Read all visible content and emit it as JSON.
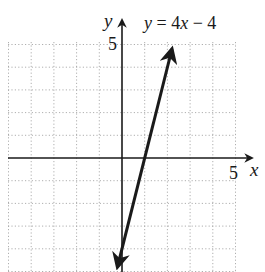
{
  "chart_data": {
    "type": "line",
    "title": "",
    "equation_label": "y = 4x − 4",
    "xlabel": "x",
    "ylabel": "y",
    "x_tick_labels": [
      {
        "value": 5,
        "label": "5"
      }
    ],
    "y_tick_labels": [
      {
        "value": 5,
        "label": "5"
      }
    ],
    "xlim": [
      -5,
      5
    ],
    "ylim": [
      -5,
      5
    ],
    "grid": true,
    "grid_style": "dotted",
    "series": [
      {
        "name": "y = 4x − 4",
        "slope": 4,
        "intercept": -4,
        "x": [
          -0.2,
          0,
          1,
          2,
          2.2
        ],
        "y": [
          -4.8,
          -4,
          0,
          4,
          4.8
        ]
      }
    ]
  },
  "labels": {
    "equation": "y = 4x − 4",
    "equation_y": "y",
    "equation_rest": " = 4",
    "equation_x": "x",
    "equation_tail": " − 4",
    "x_axis": "x",
    "y_axis": "y",
    "x_tick": "5",
    "y_tick": "5"
  },
  "colors": {
    "axis": "#1a1a1a",
    "line": "#1a1a1a",
    "grid": "#9a9a9a",
    "background": "#ffffff"
  }
}
